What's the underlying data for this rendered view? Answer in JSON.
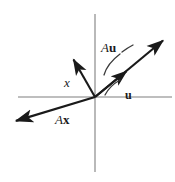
{
  "figure": {
    "background_color": "#ffffff",
    "width": 175,
    "height": 182,
    "axis_color": "#a8a8a8",
    "vector_color": "#1a1a1a"
  },
  "axes": {
    "origin": {
      "x": 95,
      "y": 97
    },
    "horizontal": {
      "x1": 18,
      "y1": 97,
      "x2": 172,
      "y2": 97
    },
    "vertical": {
      "x1": 95,
      "y1": 14,
      "x2": 95,
      "y2": 172
    }
  },
  "labels": {
    "x": {
      "text": "x",
      "style": "italic"
    },
    "u": {
      "text": "u",
      "style": "bold"
    },
    "Au_operator": {
      "text": "A",
      "style": "italic"
    },
    "Au_vector": {
      "text": "u",
      "style": "bold"
    },
    "Ax_operator": {
      "text": "A",
      "style": "italic"
    },
    "Ax_vector": {
      "text": "x",
      "style": "bold"
    }
  },
  "vectors": [
    {
      "name": "x",
      "label": "x",
      "from": {
        "x": 95,
        "y": 97
      },
      "to": {
        "x": 72,
        "y": 57
      },
      "description": "short vector pointing up and to the left"
    },
    {
      "name": "Ax",
      "label": "Ax",
      "from": {
        "x": 95,
        "y": 97
      },
      "to": {
        "x": 12,
        "y": 122
      },
      "description": "long vector pointing down and to the left"
    },
    {
      "name": "u",
      "label": "u",
      "from": {
        "x": 95,
        "y": 97
      },
      "to": {
        "x": 129,
        "y": 69
      },
      "description": "short vector pointing up and to the right"
    },
    {
      "name": "Au",
      "label": "Au",
      "from": {
        "x": 95,
        "y": 97
      },
      "to": {
        "x": 166,
        "y": 38
      },
      "description": "long vector pointing up and to the right, same direction as u"
    }
  ],
  "pointer_strokes": [
    {
      "name": "au-pointer",
      "description": "curved hand-drawn stroke from the Au label toward the long right vector"
    },
    {
      "name": "u-pointer",
      "description": "short curved hand-drawn stroke from the u label toward the short right vector"
    }
  ]
}
